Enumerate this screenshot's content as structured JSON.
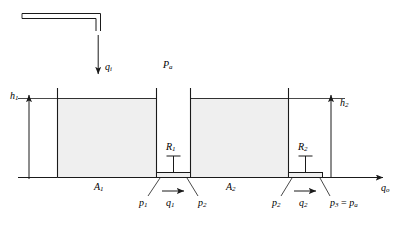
{
  "figure": {
    "colors": {
      "line": "#1a1a1a",
      "liquid": "#efefef",
      "background": "#ffffff"
    }
  },
  "labels": {
    "inflow": {
      "base": "q",
      "sub": "i",
      "text": "qi"
    },
    "atmospheric_top": {
      "base": "P",
      "sub": "a",
      "text": "Pa"
    },
    "head1": {
      "base": "h",
      "sub": "1",
      "text": "h1"
    },
    "head2": {
      "base": "h",
      "sub": "2",
      "text": "h2"
    },
    "area1": {
      "base": "A",
      "sub": "1",
      "text": "A1"
    },
    "area2": {
      "base": "A",
      "sub": "2",
      "text": "A2"
    },
    "resistance1": {
      "base": "R",
      "sub": "1",
      "text": "R1"
    },
    "resistance2": {
      "base": "R",
      "sub": "2",
      "text": "R2"
    },
    "pressure1": {
      "base": "p",
      "sub": "1",
      "text": "p1"
    },
    "flow1": {
      "base": "q",
      "sub": "1",
      "text": "q1"
    },
    "pressure2_left": {
      "base": "p",
      "sub": "2",
      "text": "p2"
    },
    "pressure2_right": {
      "base": "p",
      "sub": "2",
      "text": "p2"
    },
    "flow2": {
      "base": "q",
      "sub": "2",
      "text": "q2"
    },
    "pressure3": {
      "base": "p",
      "sub": "3",
      "eq": " = ",
      "base2": "p",
      "sub2": "a",
      "text": "p3 = pa"
    },
    "outflow": {
      "base": "q",
      "sub": "o",
      "text": "qo"
    }
  },
  "components": [
    {
      "name": "inlet-pipe",
      "kind": "pipe"
    },
    {
      "name": "tank-1",
      "kind": "tank",
      "area": "A1",
      "head": "h1"
    },
    {
      "name": "tank-2",
      "kind": "tank",
      "area": "A2",
      "head": "h2"
    },
    {
      "name": "valve-1",
      "kind": "restriction",
      "resistance": "R1"
    },
    {
      "name": "valve-2",
      "kind": "restriction",
      "resistance": "R2"
    }
  ]
}
